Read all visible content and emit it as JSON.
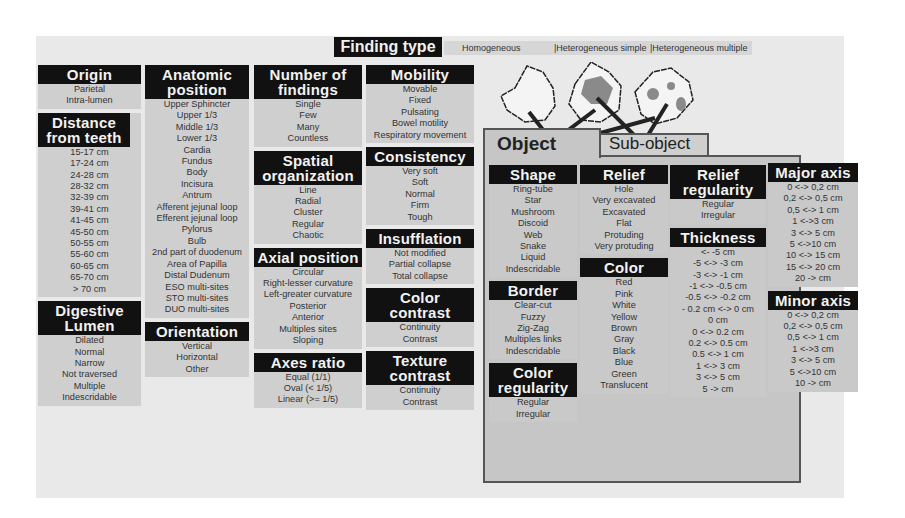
{
  "finding_type": {
    "label": "Finding type",
    "options": [
      "Homogeneous",
      "|Heterogeneous simple",
      "|Heterogeneous multiple"
    ]
  },
  "columns": {
    "col1": [
      {
        "title": "Origin",
        "items": [
          "Parietal",
          "Intra-lumen"
        ]
      },
      {
        "title": "Distance from teeth",
        "items": [
          "15-17 cm",
          "17-24 cm",
          "24-28 cm",
          "28-32 cm",
          "32-39 cm",
          "39-41 cm",
          "41-45 cm",
          "45-50 cm",
          "50-55 cm",
          "55-60 cm",
          "60-65 cm",
          "65-70 cm",
          "> 70 cm"
        ]
      },
      {
        "title": "Digestive Lumen",
        "items": [
          "Dilated",
          "Normal",
          "Narrow",
          "Not traversed",
          "Multiple",
          "Indescridable"
        ]
      }
    ],
    "col2": [
      {
        "title": "Anatomic position",
        "items": [
          "Upper Sphincter",
          "Upper 1/3",
          "Middle 1/3",
          "Lower 1/3",
          "Cardia",
          "Fundus",
          "Body",
          "Incisura",
          "Antrum",
          "Afferent jejunal loop",
          "Efferent jejunal loop",
          "Pylorus",
          "Bulb",
          "2nd part of duodenum",
          "Area of Papilla",
          "Distal Dudenum",
          "ESO multi-sites",
          "STO multi-sites",
          "DUO multi-sites"
        ]
      },
      {
        "title": "Orientation",
        "items": [
          "Vertical",
          "Horizontal",
          "Other"
        ]
      }
    ],
    "col3": [
      {
        "title": "Number of findings",
        "items": [
          "Single",
          "Few",
          "Many",
          "Countless"
        ]
      },
      {
        "title": "Spatial organization",
        "items": [
          "Line",
          "Radial",
          "Cluster",
          "Regular",
          "Chaotic"
        ]
      },
      {
        "title": "Axial position",
        "items": [
          "Circular",
          "Right-lesser curvature",
          "Left-greater curvature",
          "Posterior",
          "Anterior",
          "Multiples sites",
          "Sloping"
        ]
      },
      {
        "title": "Axes ratio",
        "items": [
          "Equal (1/1)",
          "Oval (< 1/5)",
          "Linear (>= 1/5)"
        ]
      }
    ],
    "col4": [
      {
        "title": "Mobility",
        "items": [
          "Movable",
          "Fixed",
          "Pulsating",
          "Bowel motility",
          "Respiratory movement"
        ]
      },
      {
        "title": "Consistency",
        "items": [
          "Very soft",
          "Soft",
          "Normal",
          "Firm",
          "Tough"
        ]
      },
      {
        "title": "Insufflation",
        "items": [
          "Not modified",
          "Partial collapse",
          "Total collapse"
        ]
      },
      {
        "title": "Color contrast",
        "items": [
          "Continuity",
          "Contrast"
        ]
      },
      {
        "title": "Texture contrast",
        "items": [
          "Continuity",
          "Contrast"
        ]
      }
    ]
  },
  "tabs": {
    "object": "Object",
    "sub_object": "Sub-object"
  },
  "object_columns": {
    "o1": [
      {
        "title": "Shape",
        "items": [
          "Ring-tube",
          "Star",
          "Mushroom",
          "Discoid",
          "Web",
          "Snake",
          "Liquid",
          "Indescridable"
        ]
      },
      {
        "title": "Border",
        "items": [
          "Clear-cut",
          "Fuzzy",
          "Zig-Zag",
          "Multiples links",
          "Indescridable"
        ]
      },
      {
        "title": "Color regularity",
        "items": [
          "Regular",
          "Irregular"
        ]
      }
    ],
    "o2": [
      {
        "title": "Relief",
        "items": [
          "Hole",
          "Very excavated",
          "Excavated",
          "Flat",
          "Protuding",
          "Very protuding"
        ]
      },
      {
        "title": "Color",
        "items": [
          "Red",
          "Pink",
          "White",
          "Yellow",
          "Brown",
          "Gray",
          "Black",
          "Blue",
          "Green",
          "Translucent"
        ]
      }
    ],
    "o3": [
      {
        "title": "Relief regularity",
        "items": [
          "Regular",
          "Irregular"
        ]
      },
      {
        "title": "Thickness",
        "items": [
          "<- -5 cm",
          "-5 <-> -3 cm",
          "-3 <-> -1 cm",
          "-1 <-> -0.5 cm",
          "-0.5 <-> -0.2 cm",
          "- 0.2 cm <-> 0 cm",
          "0 cm",
          "0 <-> 0.2 cm",
          "0.2 <-> 0.5 cm",
          "0.5 <-> 1 cm",
          "1 <-> 3 cm",
          "3 <-> 5 cm",
          "5 -> cm"
        ]
      }
    ],
    "o4": [
      {
        "title": "Major axis",
        "items": [
          "0 <-> 0,2 cm",
          "0,2 <-> 0,5 cm",
          "0,5 <-> 1 cm",
          "1 <->3 cm",
          "3 <-> 5 cm",
          "5 <->10 cm",
          "10 <-> 15 cm",
          "15 <-> 20 cm",
          "20 -> cm"
        ]
      },
      {
        "title": "Minor axis",
        "items": [
          "0 <-> 0,2 cm",
          "0,2 <-> 0,5 cm",
          "0,5 <-> 1 cm",
          "1 <->3 cm",
          "3 <-> 5 cm",
          "5 <->10 cm",
          "10 -> cm"
        ]
      }
    ]
  }
}
